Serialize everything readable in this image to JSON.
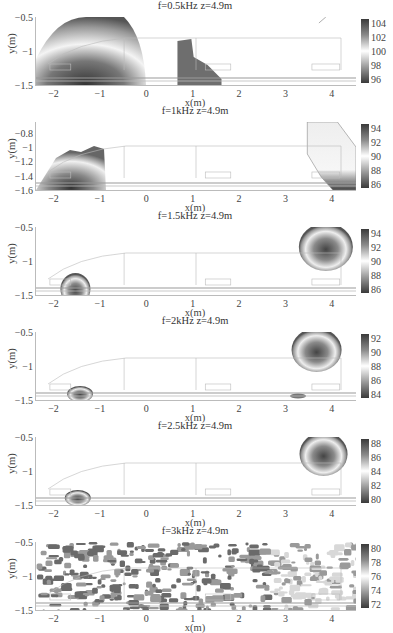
{
  "chart_data": [
    {
      "type": "heatmap",
      "title": "f=0.5kHz z=4.9m",
      "xlabel": "x(m)",
      "ylabel": "y(m)",
      "xlim": [
        -2.4,
        4.5
      ],
      "ylim": [
        -1.5,
        -0.5
      ],
      "xticks": [
        "-2",
        "-1",
        "0",
        "1",
        "2",
        "3",
        "4"
      ],
      "yticks": [
        "-0.5",
        "-1",
        "-1.5"
      ],
      "colorbar": {
        "min": 95,
        "max": 105,
        "ticks": [
          "104",
          "102",
          "100",
          "98",
          "96"
        ]
      },
      "hotspots": [
        {
          "x_range": [
            -2.4,
            -0.2
          ],
          "y_range": [
            -1.5,
            -0.5
          ],
          "peak_x": -1.5,
          "peak_y": -1.45,
          "note": "large semicircular region"
        },
        {
          "x_range": [
            0.65,
            1.6
          ],
          "y_range": [
            -1.5,
            -0.9
          ],
          "note": "stepped block region"
        }
      ]
    },
    {
      "type": "heatmap",
      "title": "f=1kHz z=4.9m",
      "xlabel": "x(m)",
      "ylabel": "y(m)",
      "xlim": [
        -2.4,
        4.5
      ],
      "ylim": [
        -1.6,
        -0.65
      ],
      "xticks": [
        "-2",
        "-1",
        "0",
        "1",
        "2",
        "3",
        "4"
      ],
      "yticks": [
        "-0.8",
        "-1",
        "-1.2",
        "-1.4",
        "-1.6"
      ],
      "colorbar": {
        "min": 86,
        "max": 96,
        "ticks": [
          "94",
          "92",
          "90",
          "88",
          "86"
        ]
      },
      "hotspots": [
        {
          "x_range": [
            -2.4,
            -0.8
          ],
          "y_range": [
            -1.6,
            -1.0
          ],
          "peak_x": -1.7,
          "peak_y": -1.55
        },
        {
          "x_range": [
            3.4,
            4.5
          ],
          "y_range": [
            -1.6,
            -0.65
          ],
          "peak_x": 4.2,
          "peak_y": -1.55
        }
      ]
    },
    {
      "type": "heatmap",
      "title": "f=1.5kHz z=4.9m",
      "xlabel": "x(m)",
      "ylabel": "y(m)",
      "xlim": [
        -2.4,
        4.5
      ],
      "ylim": [
        -1.5,
        -0.5
      ],
      "xticks": [
        "-2",
        "-1",
        "0",
        "1",
        "2",
        "3",
        "4"
      ],
      "yticks": [
        "-0.5",
        "-1",
        "-1.5"
      ],
      "colorbar": {
        "min": 85,
        "max": 95,
        "ticks": [
          "94",
          "92",
          "90",
          "88",
          "86"
        ]
      },
      "hotspots": [
        {
          "x_range": [
            -2.0,
            -1.1
          ],
          "y_range": [
            -1.5,
            -1.2
          ],
          "peak_x": -1.5,
          "peak_y": -1.45
        },
        {
          "x_range": [
            3.3,
            4.4
          ],
          "y_range": [
            -1.2,
            -0.5
          ],
          "peak_x": 3.85,
          "peak_y": -0.85
        }
      ]
    },
    {
      "type": "heatmap",
      "title": "f=2kHz z=4.9m",
      "xlabel": "x(m)",
      "ylabel": "y(m)",
      "xlim": [
        -2.4,
        4.5
      ],
      "ylim": [
        -1.5,
        -0.5
      ],
      "xticks": [
        "-2",
        "-1",
        "0",
        "1",
        "2",
        "3",
        "4"
      ],
      "yticks": [
        "-0.5",
        "-1",
        "-1.5"
      ],
      "colorbar": {
        "min": 83.5,
        "max": 93,
        "ticks": [
          "92",
          "90",
          "88",
          "86",
          "84"
        ]
      },
      "hotspots": [
        {
          "x_range": [
            -1.75,
            -1.1
          ],
          "y_range": [
            -1.5,
            -1.35
          ],
          "peak_x": -1.5,
          "peak_y": -1.45
        },
        {
          "x_range": [
            3.1,
            3.5
          ],
          "y_range": [
            -1.5,
            -1.45
          ]
        },
        {
          "x_range": [
            3.1,
            4.3
          ],
          "y_range": [
            -1.15,
            -0.55
          ],
          "peak_x": 3.65,
          "peak_y": -0.8
        }
      ]
    },
    {
      "type": "heatmap",
      "title": "f=2.5kHz z=4.9m",
      "xlabel": "x(m)",
      "ylabel": "y(m)",
      "xlim": [
        -2.4,
        4.5
      ],
      "ylim": [
        -1.5,
        -0.5
      ],
      "xticks": [
        "-2",
        "-1",
        "0",
        "1",
        "2",
        "3",
        "4"
      ],
      "yticks": [
        "-0.5",
        "-1",
        "-1.5"
      ],
      "colorbar": {
        "min": 78.5,
        "max": 88.5,
        "ticks": [
          "88",
          "86",
          "84",
          "82",
          "80"
        ]
      },
      "hotspots": [
        {
          "x_range": [
            -1.85,
            -1.15
          ],
          "y_range": [
            -1.5,
            -1.35
          ],
          "peak_x": -1.55,
          "peak_y": -1.45
        },
        {
          "x_range": [
            3.2,
            4.3
          ],
          "y_range": [
            -1.2,
            -0.5
          ],
          "peak_x": 3.8,
          "peak_y": -0.75
        }
      ]
    },
    {
      "type": "heatmap",
      "title": "f=3kHz z=4.9m",
      "xlabel": "x(m)",
      "ylabel": "y(m)",
      "xlim": [
        -2.4,
        4.5
      ],
      "ylim": [
        -1.5,
        -0.5
      ],
      "xticks": [
        "-2",
        "-1",
        "0",
        "1",
        "2",
        "3",
        "4"
      ],
      "yticks": [
        "-0.5",
        "-1",
        "-1.5"
      ],
      "colorbar": {
        "min": 71,
        "max": 81,
        "ticks": [
          "80",
          "78",
          "76",
          "74",
          "72"
        ]
      },
      "hotspots": [
        {
          "x_range": [
            -2.4,
            4.5
          ],
          "y_range": [
            -1.5,
            -0.5
          ],
          "note": "noisy scattered blotches across full field"
        }
      ]
    }
  ],
  "panels": [
    {
      "title": "f=0.5kHz z=4.9m",
      "yticks": [
        {
          "label": "-0.5",
          "pos": 0
        },
        {
          "label": "-1",
          "pos": 0.5
        },
        {
          "label": "-1.5",
          "pos": 1
        }
      ],
      "cticks": [
        "104",
        "102",
        "100",
        "98",
        "96"
      ]
    },
    {
      "title": "f=1kHz z=4.9m",
      "yticks": [
        {
          "label": "-0.8",
          "pos": 0.16
        },
        {
          "label": "-1",
          "pos": 0.37
        },
        {
          "label": "-1.2",
          "pos": 0.58
        },
        {
          "label": "-1.4",
          "pos": 0.79
        },
        {
          "label": "-1.6",
          "pos": 1
        }
      ],
      "cticks": [
        "94",
        "92",
        "90",
        "88",
        "86"
      ]
    },
    {
      "title": "f=1.5kHz z=4.9m",
      "yticks": [
        {
          "label": "-0.5",
          "pos": 0
        },
        {
          "label": "-1",
          "pos": 0.5
        },
        {
          "label": "-1.5",
          "pos": 1
        }
      ],
      "cticks": [
        "94",
        "92",
        "90",
        "88",
        "86"
      ]
    },
    {
      "title": "f=2kHz z=4.9m",
      "yticks": [
        {
          "label": "-0.5",
          "pos": 0
        },
        {
          "label": "-1",
          "pos": 0.5
        },
        {
          "label": "-1.5",
          "pos": 1
        }
      ],
      "cticks": [
        "92",
        "90",
        "88",
        "86",
        "84"
      ]
    },
    {
      "title": "f=2.5kHz z=4.9m",
      "yticks": [
        {
          "label": "-0.5",
          "pos": 0
        },
        {
          "label": "-1",
          "pos": 0.5
        },
        {
          "label": "-1.5",
          "pos": 1
        }
      ],
      "cticks": [
        "88",
        "86",
        "84",
        "82",
        "80"
      ]
    },
    {
      "title": "f=3kHz z=4.9m",
      "yticks": [
        {
          "label": "-0.5",
          "pos": 0
        },
        {
          "label": "-1",
          "pos": 0.5
        },
        {
          "label": "-1.5",
          "pos": 1
        }
      ],
      "cticks": [
        "80",
        "78",
        "76",
        "74",
        "72"
      ]
    }
  ],
  "axes": {
    "xlabel": "x(m)",
    "ylabel": "y(m)",
    "xticks": [
      "-2",
      "-1",
      "0",
      "1",
      "2",
      "3",
      "4"
    ]
  }
}
